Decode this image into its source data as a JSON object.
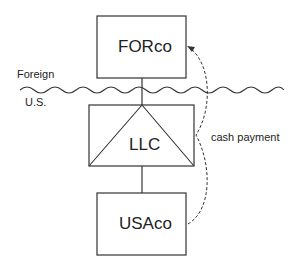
{
  "diagram": {
    "entities": {
      "top": {
        "label": "FORco"
      },
      "middle": {
        "label": "LLC"
      },
      "bottom": {
        "label": "USAco"
      }
    },
    "border": {
      "above_label": "Foreign",
      "below_label": "U.S."
    },
    "flow": {
      "label": "cash payment",
      "from": "USAco",
      "to": "FORco",
      "style": "dashed"
    },
    "colors": {
      "line": "#333333",
      "background": "#ffffff"
    }
  }
}
